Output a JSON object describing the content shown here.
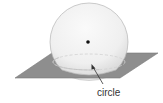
{
  "diagram": {
    "labels": {
      "circle": "circle"
    },
    "colors": {
      "sphere_fill": "#f4f4f4",
      "sphere_stroke": "#b8b8b8",
      "plane_fill": "#8c8c8c",
      "plane_stroke": "#777777",
      "dashed": "#d9d9d9",
      "center_dot": "#111111",
      "arrow": "#333333"
    }
  }
}
